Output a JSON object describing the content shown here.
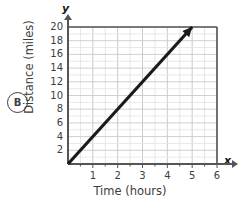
{
  "choice": {
    "letter": "B"
  },
  "axes": {
    "y_axis_letter": "y",
    "x_axis_letter": "x",
    "ylabel": "Distance (miles)",
    "xlabel": "Time (hours)"
  },
  "chart_data": {
    "type": "line",
    "title": "",
    "xlabel": "Time (hours)",
    "ylabel": "Distance (miles)",
    "xlim": [
      0,
      6
    ],
    "ylim": [
      0,
      20
    ],
    "xticks": [
      1,
      2,
      3,
      4,
      5,
      6
    ],
    "yticks": [
      2,
      4,
      6,
      8,
      10,
      12,
      14,
      16,
      18,
      20
    ],
    "xtick_labels": [
      "1",
      "2",
      "3",
      "4",
      "5",
      "6"
    ],
    "ytick_labels": [
      "2",
      "4",
      "6",
      "8",
      "10",
      "12",
      "14",
      "16",
      "18",
      "20"
    ],
    "x_minor_step": 0.5,
    "y_minor_step": 1,
    "grid": true,
    "legend": false,
    "series": [
      {
        "name": "Distance vs Time",
        "x": [
          0,
          5
        ],
        "y": [
          0,
          20
        ],
        "slope": 4,
        "arrow_end": true,
        "color": "#1a1a1a"
      }
    ]
  },
  "colors": {
    "line": "#1a1a1a",
    "axis": "#555555",
    "grid_major": "#c9c9cf",
    "grid_minor": "#e3e3e8",
    "text": "#3d3d3d"
  }
}
